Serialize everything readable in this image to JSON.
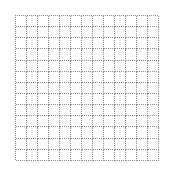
{
  "grid": {
    "rows": 13,
    "columns": 13,
    "line_style": "dotted",
    "line_color": "#8a8a8a",
    "background": "#ffffff"
  }
}
